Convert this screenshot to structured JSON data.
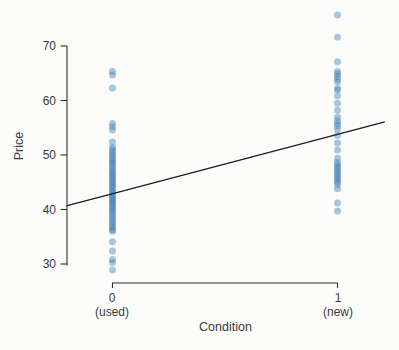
{
  "figure": {
    "background": "#fcfcfb",
    "point_color": "#4682b4",
    "point_opacity": 0.45,
    "point_radius": 3.5,
    "axis_color": "#2e2e2e",
    "line_color": "#1c1c1c",
    "text_color": "#3b3b3b"
  },
  "chart_data": {
    "type": "scatter",
    "title": "",
    "xlabel": "Condition",
    "ylabel": "Price",
    "x_ticks": [
      {
        "value": 0,
        "label": "0",
        "sublabel": "(used)"
      },
      {
        "value": 1,
        "label": "1",
        "sublabel": "(new)"
      }
    ],
    "y_ticks": [
      70,
      60,
      50,
      40,
      30
    ],
    "ylim": [
      27,
      77
    ],
    "xlim": [
      -0.25,
      1.25
    ],
    "grid": false,
    "legend": "none",
    "series": [
      {
        "name": "used",
        "x": 0,
        "prices": [
          65.3,
          64.7,
          62.3,
          55.8,
          55.2,
          54.6,
          52.4,
          51.4,
          51.0,
          50.6,
          50.2,
          49.8,
          49.4,
          49.0,
          48.7,
          48.4,
          48.0,
          47.6,
          47.2,
          46.9,
          46.6,
          46.2,
          45.9,
          45.6,
          45.2,
          44.9,
          44.6,
          44.2,
          43.9,
          43.6,
          43.2,
          42.9,
          42.6,
          42.3,
          42.0,
          41.7,
          41.4,
          41.1,
          40.8,
          40.5,
          40.1,
          39.8,
          39.4,
          39.0,
          38.6,
          38.2,
          37.8,
          37.4,
          37.0,
          36.6,
          36.3,
          36.0,
          34.1,
          32.4,
          30.8,
          30.3,
          28.9
        ]
      },
      {
        "name": "new",
        "x": 1,
        "prices": [
          75.7,
          71.6,
          67.1,
          65.3,
          64.9,
          64.4,
          63.9,
          63.4,
          62.2,
          61.9,
          60.8,
          59.5,
          58.2,
          57.0,
          56.3,
          55.8,
          55.3,
          54.7,
          53.6,
          52.2,
          50.9,
          49.4,
          48.6,
          48.2,
          47.8,
          47.4,
          47.0,
          46.6,
          46.2,
          45.8,
          45.4,
          45.0,
          44.6,
          43.8,
          41.2,
          39.7
        ]
      }
    ],
    "regression_line": {
      "intercept": 42.9,
      "slope": 10.9,
      "x_start": -0.205,
      "x_end": 1.21
    }
  }
}
